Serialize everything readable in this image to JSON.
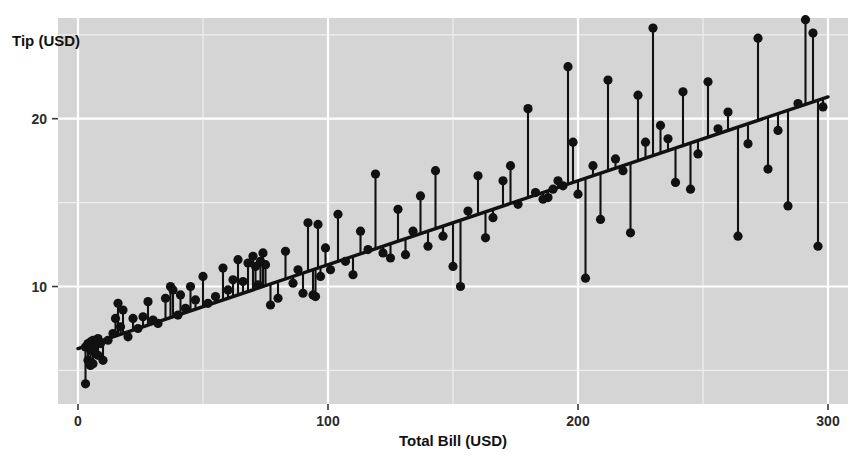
{
  "chart_data": {
    "type": "scatter",
    "title": "",
    "subtitle": "",
    "xlabel": "Total Bill (USD)",
    "ylabel": "Tip (USD)",
    "xlim": [
      -8,
      308
    ],
    "ylim": [
      3.0,
      26.0
    ],
    "xticks": [
      0,
      100,
      200,
      300
    ],
    "xtick_labels": [
      "0",
      "100",
      "200",
      "300"
    ],
    "yticks": [
      10,
      20
    ],
    "ytick_labels": [
      "10",
      "20"
    ],
    "grid": true,
    "grid_major_color": "#ffffff",
    "grid_minor_color": "#eeeeee",
    "panel_background": "#d5d5d5",
    "figure_background": "#ffffff",
    "point_color": "#111111",
    "line_color": "#111111",
    "residual_color": "#111111",
    "legend": null,
    "legend_position": "none",
    "annotations": [],
    "fit_line": {
      "name": "linear fit",
      "x_start": 0,
      "y_start": 6.3,
      "x_end": 300,
      "y_end": 21.3,
      "intercept": 6.3,
      "slope": 0.05
    },
    "x": [
      3,
      3,
      4,
      4,
      4,
      5,
      5,
      5,
      6,
      6,
      6,
      7,
      7,
      8,
      8,
      9,
      10,
      12,
      14,
      15,
      16,
      17,
      18,
      20,
      22,
      24,
      26,
      28,
      30,
      32,
      35,
      37,
      38,
      40,
      41,
      43,
      45,
      47,
      50,
      52,
      55,
      58,
      60,
      62,
      64,
      66,
      68,
      70,
      71,
      72,
      73,
      74,
      75,
      77,
      80,
      83,
      86,
      88,
      90,
      92,
      94,
      95,
      96,
      97,
      99,
      101,
      104,
      107,
      110,
      113,
      116,
      119,
      122,
      125,
      128,
      131,
      134,
      137,
      140,
      143,
      146,
      150,
      153,
      156,
      160,
      163,
      166,
      170,
      173,
      176,
      180,
      183,
      186,
      188,
      190,
      192,
      194,
      196,
      198,
      200,
      203,
      206,
      209,
      212,
      215,
      218,
      221,
      224,
      227,
      230,
      233,
      236,
      239,
      242,
      245,
      248,
      252,
      256,
      260,
      264,
      268,
      272,
      276,
      280,
      284,
      288,
      291,
      294,
      296,
      298
    ],
    "y": [
      4.2,
      6.4,
      5.6,
      6.5,
      6.6,
      5.3,
      6.2,
      6.7,
      5.4,
      6.3,
      6.8,
      6.0,
      6.7,
      5.9,
      6.9,
      6.6,
      5.6,
      6.8,
      7.2,
      8.1,
      9.0,
      7.6,
      8.6,
      7.0,
      8.1,
      7.5,
      8.2,
      9.1,
      8.0,
      7.8,
      9.3,
      10.0,
      9.8,
      8.3,
      9.5,
      8.7,
      10.0,
      9.2,
      10.6,
      9.0,
      9.4,
      11.1,
      9.8,
      10.4,
      11.6,
      10.3,
      11.4,
      11.8,
      11.2,
      10.1,
      11.5,
      12.0,
      11.3,
      8.9,
      9.3,
      12.1,
      10.2,
      11.0,
      9.6,
      13.8,
      9.5,
      9.4,
      13.7,
      10.6,
      12.3,
      11.0,
      14.3,
      11.5,
      10.7,
      13.3,
      12.2,
      16.7,
      12.0,
      11.7,
      14.6,
      11.9,
      13.3,
      15.4,
      12.4,
      16.9,
      13.0,
      11.2,
      10.0,
      14.5,
      16.6,
      12.9,
      14.1,
      16.3,
      17.2,
      14.9,
      20.6,
      15.6,
      15.2,
      15.3,
      15.8,
      16.3,
      16.0,
      23.1,
      18.6,
      15.5,
      10.5,
      17.2,
      14.0,
      22.3,
      17.6,
      16.9,
      13.2,
      21.4,
      18.6,
      25.4,
      19.6,
      18.8,
      16.2,
      21.6,
      15.8,
      17.9,
      22.2,
      19.4,
      20.4,
      13.0,
      18.5,
      24.8,
      17.0,
      19.3,
      14.8,
      20.9,
      25.9,
      25.1,
      12.4,
      20.7,
      23.7
    ]
  },
  "labels": {
    "y_axis_title": "Tip (USD)",
    "x_axis_title": "Total Bill (USD)",
    "ytick_0": "10",
    "ytick_1": "20",
    "xtick_0": "0",
    "xtick_1": "100",
    "xtick_2": "200",
    "xtick_3": "300"
  }
}
